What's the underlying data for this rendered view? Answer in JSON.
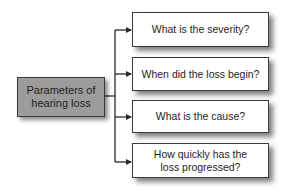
{
  "diagram": {
    "type": "tree",
    "root": {
      "label": "Parameters of hearing loss",
      "line1": "Parameters of",
      "line2": "hearing loss",
      "fill_color": "#9c9c9c"
    },
    "branches": [
      {
        "label": "What is the severity?"
      },
      {
        "label": "When did the loss begin?"
      },
      {
        "label": "What is the cause?"
      },
      {
        "label": "How quickly has the loss progressed?",
        "line1": "How quickly has the",
        "line2": "loss progressed?"
      }
    ],
    "colors": {
      "line": "#2a2a2a",
      "branch_fill": "#ffffff",
      "root_fill": "#9c9c9c",
      "text": "#1e1e1e"
    }
  }
}
